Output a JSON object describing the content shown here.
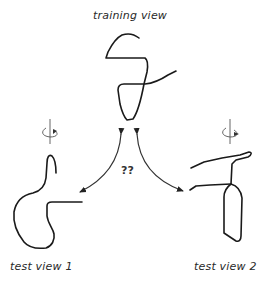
{
  "labels": {
    "training": "training view",
    "test1": "test view 1",
    "test2": "test view 2",
    "question": "??"
  },
  "icons": {
    "rotation_left": "rotation-about-vertical-axis-icon",
    "rotation_right": "rotation-about-vertical-axis-icon"
  },
  "colors": {
    "stroke": "#1a1a1a",
    "text": "#2a2a2a",
    "background": "#ffffff"
  }
}
